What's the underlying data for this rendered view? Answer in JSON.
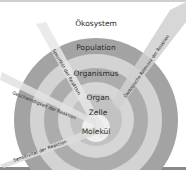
{
  "diagram": {
    "levels": [
      {
        "label": "Ökosystem",
        "color": "#9a9a9a"
      },
      {
        "label": "Population",
        "color": "#cfcfcf"
      },
      {
        "label": "Organismus",
        "color": "#a8a8a8"
      },
      {
        "label": "Organ",
        "color": "#d4d4d4"
      },
      {
        "label": "Zelle",
        "color": "#bdbdbd"
      },
      {
        "label": "Molekül",
        "color": "#ececec"
      }
    ],
    "beams": [
      {
        "label": "Spezifität der Reaktion"
      },
      {
        "label": "Geschwindigkeit der Reaktion"
      },
      {
        "label": "Sensitivität der Reaktion"
      },
      {
        "label": "Ökologische Relevanz der Reaktion"
      }
    ]
  }
}
